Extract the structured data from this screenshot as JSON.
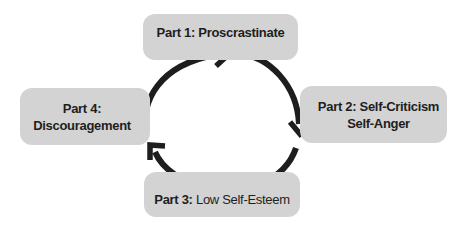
{
  "diagram": {
    "type": "cycle",
    "colors": {
      "box_fill": "#d3d3d3",
      "arrow": "#1e1e1e",
      "text": "#1e1e1e"
    },
    "nodes": [
      {
        "id": "part1",
        "label_bold": "Part 1:",
        "label_rest": "Proscrastinate",
        "rest_bold": true
      },
      {
        "id": "part2",
        "label_bold": "Part 2:",
        "label_rest": "Self-Criticism",
        "line2": "Self-Anger",
        "rest_bold": true
      },
      {
        "id": "part3",
        "label_bold": "Part 3:",
        "label_rest": "Low Self-Esteem",
        "rest_bold": false
      },
      {
        "id": "part4",
        "label_bold": "Part 4:",
        "line2": "Discouragement",
        "rest_bold": true
      }
    ],
    "edges": [
      {
        "from": "part1",
        "to": "part2",
        "direction": "clockwise"
      },
      {
        "from": "part2",
        "to": "part3",
        "direction": "clockwise"
      },
      {
        "from": "part3",
        "to": "part4",
        "direction": "clockwise"
      },
      {
        "from": "part4",
        "to": "part1",
        "direction": "clockwise"
      }
    ]
  }
}
